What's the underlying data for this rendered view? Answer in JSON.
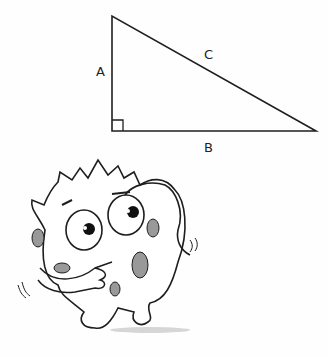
{
  "diagram": {
    "type": "right-triangle",
    "labels": {
      "side_a": "A",
      "side_b": "B",
      "side_c": "C"
    },
    "right_angle_marker": true
  },
  "illustration": {
    "subject": "confused-spotted-monster-character"
  },
  "colors": {
    "line": "#1e1e1e",
    "shading": "#9a9a9a",
    "background": "#fefefe"
  }
}
